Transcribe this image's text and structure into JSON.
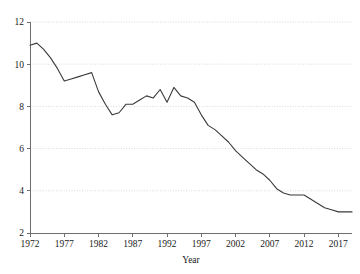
{
  "chart_data": {
    "type": "line",
    "title": "",
    "xlabel": "Year",
    "ylabel": "",
    "xlim": [
      1972,
      2019
    ],
    "ylim": [
      2,
      12
    ],
    "grid": true,
    "legend": "none",
    "xticks": [
      1972,
      1977,
      1982,
      1987,
      1992,
      1997,
      2002,
      2007,
      2012,
      2017
    ],
    "yticks": [
      2,
      4,
      6,
      8,
      10,
      12
    ],
    "xtick_labels": [
      "1972",
      "1977",
      "1982",
      "1987",
      "1992",
      "1997",
      "2002",
      "2007",
      "2012",
      "2017"
    ],
    "ytick_labels": [
      "2",
      "4",
      "6",
      "8",
      "10",
      "12"
    ],
    "line_color": "#3a3a3a",
    "grid_color": "#cfcfcf",
    "axis_color": "#6e6e6e",
    "series": [
      {
        "name": "value",
        "x": [
          1972,
          1973,
          1974,
          1975,
          1976,
          1977,
          1978,
          1979,
          1980,
          1981,
          1982,
          1983,
          1984,
          1985,
          1986,
          1987,
          1988,
          1989,
          1990,
          1991,
          1992,
          1993,
          1994,
          1995,
          1996,
          1997,
          1998,
          1999,
          2000,
          2001,
          2002,
          2003,
          2004,
          2005,
          2006,
          2007,
          2008,
          2009,
          2010,
          2011,
          2012,
          2013,
          2014,
          2015,
          2016,
          2017,
          2018,
          2019
        ],
        "values": [
          10.9,
          11.0,
          10.7,
          10.3,
          9.8,
          9.2,
          9.3,
          9.4,
          9.5,
          9.6,
          8.7,
          8.1,
          7.6,
          7.7,
          8.1,
          8.1,
          8.3,
          8.5,
          8.4,
          8.8,
          8.2,
          8.9,
          8.5,
          8.4,
          8.2,
          7.6,
          7.1,
          6.9,
          6.6,
          6.3,
          5.9,
          5.6,
          5.3,
          5.0,
          4.8,
          4.5,
          4.1,
          3.9,
          3.8,
          3.8,
          3.8,
          3.6,
          3.4,
          3.2,
          3.1,
          3.0,
          3.0,
          3.0
        ]
      }
    ]
  }
}
